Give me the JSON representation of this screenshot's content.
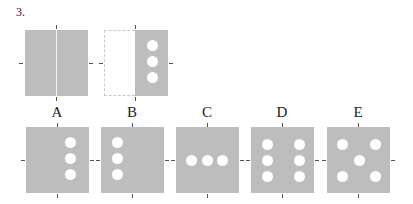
{
  "question": {
    "number": "3."
  },
  "figures": {
    "original": {
      "description": "full square with vertical fold line"
    },
    "folded": {
      "description": "left half folded onto right half, three holes punched vertically"
    }
  },
  "options": [
    {
      "label": "A",
      "holes": "3 vertical, right column"
    },
    {
      "label": "B",
      "holes": "3 vertical, left column"
    },
    {
      "label": "C",
      "holes": "3 horizontal, center row"
    },
    {
      "label": "D",
      "holes": "6 in two vertical columns"
    },
    {
      "label": "E",
      "holes": "5 in X pattern"
    }
  ],
  "colors": {
    "square": "#bdbdbd",
    "hole": "#ffffff"
  }
}
